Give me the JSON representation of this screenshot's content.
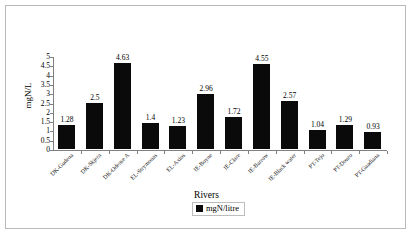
{
  "chart_data": {
    "type": "bar",
    "title": "",
    "xlabel": "Rivers",
    "ylabel": "mgN/L",
    "ylim": [
      0,
      5
    ],
    "ytick_step": 0.5,
    "grid": false,
    "legend_position": "bottom",
    "legend": [
      "mgN/litre"
    ],
    "series_name": "mgN/litre",
    "bar_color": "#0a0a0a",
    "axis_color": "#808080",
    "frame_color": "#b9b9b9",
    "yticks": [
      "0",
      "0.5",
      "1",
      "1.5",
      "2",
      "2.5",
      "3",
      "3.5",
      "4",
      "4.5",
      "5"
    ],
    "categories": [
      "DK-Gudena",
      "DK-Skjern",
      "DK-Odense A",
      "EL-Strymonas",
      "EL-Axios",
      "IE-Boyne",
      "IE-Clare",
      "IE-Barrow",
      "IE-Black water",
      "PT-Tejo",
      "PT-Douro",
      "PT-Guadiana"
    ],
    "values": [
      1.28,
      2.5,
      4.63,
      1.4,
      1.23,
      2.96,
      1.72,
      4.55,
      2.57,
      1.04,
      1.29,
      0.93
    ],
    "value_labels": [
      "1.28",
      "2.5",
      "4.63",
      "1.4",
      "1.23",
      "2.96",
      "1.72",
      "4.55",
      "2.57",
      "1.04",
      "1.29",
      "0.93"
    ]
  }
}
